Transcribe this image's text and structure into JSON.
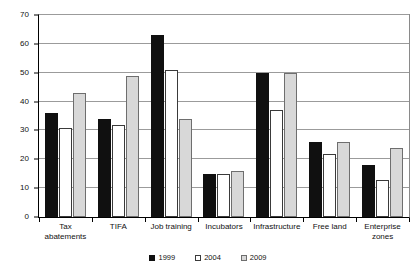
{
  "chart_data": {
    "type": "bar",
    "title": "",
    "subtitle": "",
    "xlabel": "",
    "ylabel": "",
    "ylim": [
      0,
      70
    ],
    "ytick_step": 10,
    "yticks": [
      0,
      10,
      20,
      30,
      40,
      50,
      60,
      70
    ],
    "ytick_labels": [
      "0",
      "10",
      "20",
      "30",
      "40",
      "50",
      "60",
      "70"
    ],
    "grid": true,
    "grid_axis": "y",
    "legend_position": "bottom-center",
    "categories": [
      "Tax\nabatements",
      "TIFA",
      "Job training",
      "Incubators",
      "Infrastructure",
      "Free land",
      "Enterprise\nzones"
    ],
    "series": [
      {
        "name": "1999",
        "color": "#101010",
        "values": [
          36,
          34,
          63,
          15,
          50,
          26,
          18
        ]
      },
      {
        "name": "2004",
        "color": "#ffffff",
        "values": [
          31,
          32,
          51,
          15,
          37,
          22,
          13
        ]
      },
      {
        "name": "2009",
        "color": "#d8d8d8",
        "values": [
          43,
          49,
          34,
          16,
          50,
          26,
          24
        ]
      }
    ]
  },
  "legend": {
    "entries": [
      {
        "label": "1999",
        "swatch": "s1999"
      },
      {
        "label": "2004",
        "swatch": "s2004"
      },
      {
        "label": "2009",
        "swatch": "s2009"
      }
    ]
  },
  "colors": {
    "series_1999": "#101010",
    "series_2004": "#ffffff",
    "series_2009": "#d8d8d8",
    "gridline": "#9b9b9b",
    "axis": "#000000",
    "background": "#ffffff"
  }
}
